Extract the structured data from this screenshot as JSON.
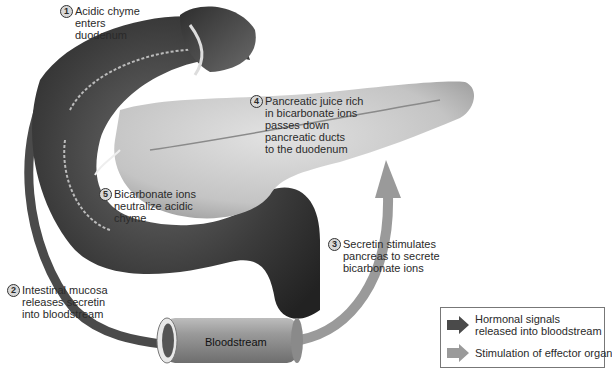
{
  "diagram": {
    "type": "physiology-feedback-loop",
    "steps": [
      {
        "number": "1",
        "text": "Acidic chyme\nenters\nduodenum"
      },
      {
        "number": "2",
        "text": "Intestinal mucosa\nreleases secretin\ninto bloodstream"
      },
      {
        "number": "3",
        "text": "Secretin stimulates\npancreas to secrete\nbicarbonate ions"
      },
      {
        "number": "4",
        "text": "Pancreatic juice rich\nin bicarbonate ions\npasses down\npancreatic ducts\nto the duodenum"
      },
      {
        "number": "5",
        "text": "Bicarbonate ions\nneutralize acidic\nchyme"
      }
    ],
    "bloodstream_label": "Bloodstream",
    "legend": {
      "items": [
        {
          "label": "Hormonal signals\nreleased into bloodstream",
          "color": "#4a4a4a"
        },
        {
          "label": "Stimulation of effector organ",
          "color": "#9a9a9a"
        }
      ]
    },
    "colors": {
      "hormonal_arrow": "#4a4a4a",
      "stimulation_arrow": "#9a9a9a",
      "organ_dark": "#3a3a3a",
      "pancreas": "#c8c8c8"
    }
  }
}
